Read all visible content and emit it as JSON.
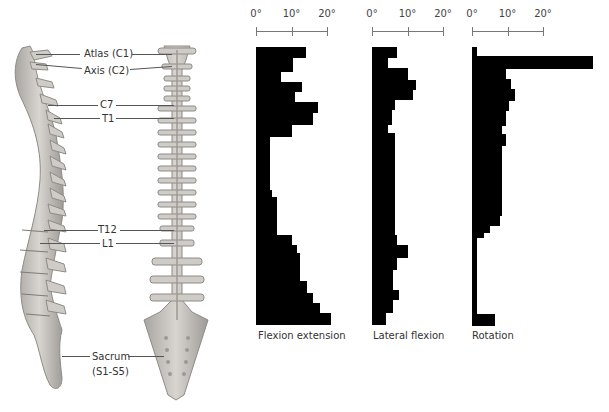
{
  "spine_labels": [
    {
      "id": "atlas",
      "text": "Atlas (C1)",
      "y": 51
    },
    {
      "id": "axis",
      "text": "Axis (C2)",
      "y": 69
    },
    {
      "id": "c7",
      "text": "C7",
      "y": 102
    },
    {
      "id": "t1",
      "text": "T1",
      "y": 118
    },
    {
      "id": "t12",
      "text": "T12",
      "y": 229
    },
    {
      "id": "l1",
      "text": "L1",
      "y": 243
    },
    {
      "id": "sacrum",
      "text": "Sacrum",
      "y": 354
    },
    {
      "id": "sacrum_range",
      "text": "(S1-S5)",
      "y": 370
    }
  ],
  "chart_data": [
    {
      "type": "bar",
      "orientation": "horizontal",
      "title": "Flexion extension",
      "xlabel": "Flexion extension",
      "xticks": [
        "0°",
        "10°",
        "20°"
      ],
      "xlim": [
        0,
        20
      ],
      "categories_top_to_bottom": "vertebral levels C1 → S1",
      "segments": [
        [
          11,
          14
        ],
        [
          14,
          10.5
        ],
        [
          10,
          7
        ],
        [
          10,
          13
        ],
        [
          10,
          11
        ],
        [
          11,
          17.5
        ],
        [
          12,
          16
        ],
        [
          12,
          10
        ],
        [
          53,
          4
        ],
        [
          7,
          4.5
        ],
        [
          38,
          6
        ],
        [
          10,
          10
        ],
        [
          8,
          11.5
        ],
        [
          28,
          12.5
        ],
        [
          12,
          14.5
        ],
        [
          10,
          16
        ],
        [
          10,
          18
        ],
        [
          12,
          21
        ]
      ]
    },
    {
      "type": "bar",
      "orientation": "horizontal",
      "title": "Lateral flexion",
      "xlabel": "Lateral flexion",
      "xticks": [
        "0°",
        "10°",
        "20°"
      ],
      "xlim": [
        0,
        20
      ],
      "categories_top_to_bottom": "vertebral levels C1 → S1",
      "segments": [
        [
          11,
          7
        ],
        [
          10,
          4.5
        ],
        [
          12,
          10
        ],
        [
          10,
          12.5
        ],
        [
          10,
          11.5
        ],
        [
          10,
          6.5
        ],
        [
          15,
          5.5
        ],
        [
          8,
          4.5
        ],
        [
          102,
          6.5
        ],
        [
          10,
          7
        ],
        [
          13,
          10
        ],
        [
          12,
          7
        ],
        [
          20,
          6
        ],
        [
          10,
          7.5
        ],
        [
          13,
          6
        ],
        [
          12,
          4
        ]
      ]
    },
    {
      "type": "bar",
      "orientation": "horizontal",
      "title": "Rotation",
      "xlabel": "Rotation",
      "xticks": [
        "0°",
        "10°",
        "20°"
      ],
      "xlim": [
        0,
        20
      ],
      "categories_top_to_bottom": "vertebral levels C1 → S1",
      "segments": [
        [
          9,
          1.5
        ],
        [
          13,
          34
        ],
        [
          10,
          9.5
        ],
        [
          10,
          11
        ],
        [
          12,
          12
        ],
        [
          10,
          10.5
        ],
        [
          15,
          9.5
        ],
        [
          8,
          8.5
        ],
        [
          12,
          9.5
        ],
        [
          70,
          8.5
        ],
        [
          10,
          8
        ],
        [
          7,
          5
        ],
        [
          5,
          3.5
        ],
        [
          76,
          1.5
        ],
        [
          12,
          6.5
        ]
      ]
    }
  ],
  "charts_layout": [
    {
      "x0": 256,
      "x10": 291.5,
      "x20": 327,
      "caption_x": 258
    },
    {
      "x0": 372,
      "x10": 407.5,
      "x20": 443,
      "caption_x": 373
    },
    {
      "x0": 472,
      "x10": 507.5,
      "x20": 543,
      "caption_x": 472
    }
  ],
  "colors": {
    "bar": "#000000",
    "bone": "#c9c6c1",
    "bone_dark": "#8f8b86",
    "leader": "#555555"
  }
}
